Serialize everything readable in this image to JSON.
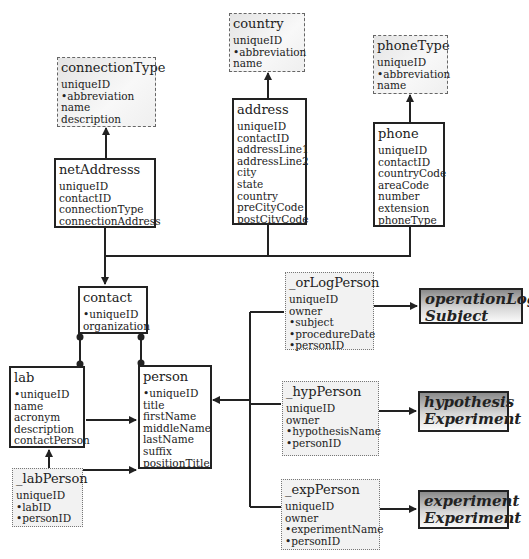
{
  "entities": {
    "connectionType": {
      "title": "connectionType",
      "fields": [
        "uniqueID",
        "•abbreviation",
        "name",
        "description"
      ]
    },
    "country": {
      "title": "country",
      "fields": [
        "uniqueID",
        "•abbreviation",
        "name"
      ]
    },
    "phoneType": {
      "title": "phoneType",
      "fields": [
        "uniqueID",
        "•abbreviation",
        "name"
      ]
    },
    "netAddresss": {
      "title": "netAddresss",
      "fields": [
        "uniqueID",
        "contactID",
        "connectionType",
        "connectionAddress"
      ]
    },
    "address": {
      "title": "address",
      "fields": [
        "uniqueID",
        "contactID",
        "addressLine1",
        "addressLine2",
        "city",
        "state",
        "country",
        "preCityCode",
        "postCityCode"
      ]
    },
    "phone": {
      "title": "phone",
      "fields": [
        "uniqueID",
        "contactID",
        "countryCode",
        "areaCode",
        "number",
        "extension",
        "phoneType"
      ]
    },
    "contact": {
      "title": "contact",
      "fields": [
        "•uniqueID",
        "organization"
      ]
    },
    "lab": {
      "title": "lab",
      "fields": [
        "•uniqueID",
        "name",
        "acronym",
        "description",
        "contactPerson"
      ]
    },
    "person": {
      "title": "person",
      "fields": [
        "•uniqueID",
        "title",
        "firstName",
        "middleName",
        "lastName",
        "suffix",
        "positionTitle"
      ]
    },
    "labPerson": {
      "title": "_labPerson",
      "fields": [
        "uniqueID",
        "•labID",
        "•personID"
      ]
    },
    "orLogPerson": {
      "title": "_orLogPerson",
      "fields": [
        "uniqueID",
        "owner",
        "•subject",
        "•procedureDate",
        "•personID"
      ]
    },
    "hypPerson": {
      "title": "_hypPerson",
      "fields": [
        "uniqueID",
        "owner",
        "•hypothesisName",
        "•personID"
      ]
    },
    "expPerson": {
      "title": "_expPerson",
      "fields": [
        "uniqueID",
        "owner",
        "•experimentName",
        "•personID"
      ]
    }
  },
  "external": {
    "operationLog": {
      "line1": "operationLog",
      "line2": "Subject"
    },
    "hypothesis": {
      "line1": "hypothesis",
      "line2": "Experiment"
    },
    "experiment": {
      "line1": "experiment",
      "line2": "Experiment"
    }
  }
}
